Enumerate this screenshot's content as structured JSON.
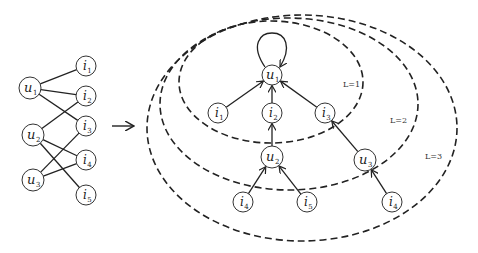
{
  "bipartite": {
    "users": [
      {
        "id": "u1",
        "base": "u",
        "sub": "1",
        "x": 30,
        "y": 88,
        "r": 11
      },
      {
        "id": "u2",
        "base": "u",
        "sub": "2",
        "x": 33,
        "y": 135,
        "r": 11
      },
      {
        "id": "u3",
        "base": "u",
        "sub": "3",
        "x": 33,
        "y": 180,
        "r": 11
      }
    ],
    "items": [
      {
        "id": "i1",
        "base": "i",
        "sub": "1",
        "x": 86,
        "y": 66,
        "r": 10
      },
      {
        "id": "i2",
        "base": "i",
        "sub": "2",
        "x": 86,
        "y": 96,
        "r": 10
      },
      {
        "id": "i3",
        "base": "i",
        "sub": "3",
        "x": 86,
        "y": 126,
        "r": 10
      },
      {
        "id": "i4",
        "base": "i",
        "sub": "4",
        "x": 86,
        "y": 160,
        "r": 10
      },
      {
        "id": "i5",
        "base": "i",
        "sub": "5",
        "x": 86,
        "y": 195,
        "r": 10
      }
    ],
    "edges": [
      [
        "u1",
        "i1"
      ],
      [
        "u1",
        "i2"
      ],
      [
        "u1",
        "i3"
      ],
      [
        "u2",
        "i2"
      ],
      [
        "u2",
        "i4"
      ],
      [
        "u2",
        "i5"
      ],
      [
        "u3",
        "i3"
      ],
      [
        "u3",
        "i4"
      ]
    ]
  },
  "arrow": {
    "x1": 112,
    "y1": 126,
    "x2": 134,
    "y2": 126
  },
  "tree": {
    "nodes": [
      {
        "id": "t_u1",
        "base": "u",
        "sub": "1",
        "x": 272,
        "y": 75,
        "r": 10
      },
      {
        "id": "t_i1",
        "base": "i",
        "sub": "1",
        "x": 218,
        "y": 113,
        "r": 10
      },
      {
        "id": "t_i2",
        "base": "i",
        "sub": "2",
        "x": 272,
        "y": 113,
        "r": 10
      },
      {
        "id": "t_i3",
        "base": "i",
        "sub": "3",
        "x": 325,
        "y": 113,
        "r": 10
      },
      {
        "id": "t_u2",
        "base": "u",
        "sub": "2",
        "x": 272,
        "y": 157,
        "r": 11
      },
      {
        "id": "t_u3",
        "base": "u",
        "sub": "3",
        "x": 365,
        "y": 160,
        "r": 11
      },
      {
        "id": "t_i4a",
        "base": "i",
        "sub": "4",
        "x": 243,
        "y": 202,
        "r": 10
      },
      {
        "id": "t_i5",
        "base": "i",
        "sub": "5",
        "x": 307,
        "y": 202,
        "r": 10
      },
      {
        "id": "t_i4b",
        "base": "i",
        "sub": "4",
        "x": 392,
        "y": 202,
        "r": 10
      }
    ],
    "edges": [
      [
        "t_i1",
        "t_u1"
      ],
      [
        "t_i2",
        "t_u1"
      ],
      [
        "t_i3",
        "t_u1"
      ],
      [
        "t_u2",
        "t_i2"
      ],
      [
        "t_u3",
        "t_i3"
      ],
      [
        "t_i4a",
        "t_u2"
      ],
      [
        "t_i5",
        "t_u2"
      ],
      [
        "t_i4b",
        "t_u3"
      ]
    ],
    "self_loop_node": "t_u1"
  },
  "levels": [
    {
      "label": "L=1",
      "cx": 271,
      "cy": 82,
      "rx": 92,
      "ry": 61,
      "lx": 343,
      "ly": 87
    },
    {
      "label": "L=2",
      "cx": 289,
      "cy": 104,
      "rx": 129,
      "ry": 86,
      "lx": 390,
      "ly": 123
    },
    {
      "label": "L=3",
      "cx": 302,
      "cy": 128,
      "rx": 155,
      "ry": 113,
      "lx": 425,
      "ly": 159
    }
  ]
}
